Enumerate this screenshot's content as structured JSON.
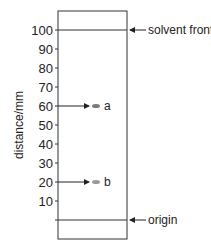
{
  "diagram": {
    "type": "paper chromatography chromatogram",
    "y_axis_label": "distance/mm",
    "ticks": [
      "10",
      "20",
      "30",
      "40",
      "50",
      "60",
      "70",
      "80",
      "90",
      "100"
    ],
    "annotations": {
      "solvent_front": "solvent front",
      "origin": "origin"
    },
    "spots": [
      {
        "label": "a",
        "distance_mm": 60,
        "color": "#7a7a7a"
      },
      {
        "label": "b",
        "distance_mm": 20,
        "color": "#9a9a9a"
      }
    ],
    "solvent_front_mm": 100,
    "origin_mm": 0
  }
}
